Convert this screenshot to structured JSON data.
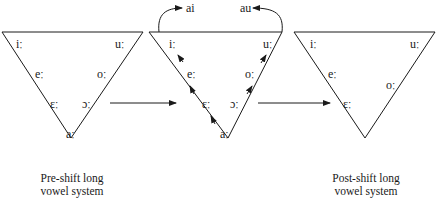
{
  "diagram": {
    "panels": [
      {
        "id": "pre-shift",
        "caption_line1": "Pre-shift long",
        "caption_line2": "vowel system",
        "vowels": {
          "i": "iː",
          "u": "uː",
          "e": "eː",
          "o": "oː",
          "eh": "ɛː",
          "oh": "ɔː",
          "a": "aː"
        }
      },
      {
        "id": "shift",
        "vowels": {
          "i": "iː",
          "u": "uː",
          "e": "eː",
          "o": "oː",
          "eh": "ɛː",
          "oh": "ɔː",
          "a": "aː"
        },
        "diphthongs": {
          "ai": "ai",
          "au": "au"
        }
      },
      {
        "id": "post-shift",
        "caption_line1": "Post-shift long",
        "caption_line2": "vowel system",
        "vowels": {
          "i": "iː",
          "u": "uː",
          "e": "eː",
          "o": "oː",
          "eh": "ɛː"
        }
      }
    ],
    "colors": {
      "line": "#1a1a1a",
      "background": "#ffffff"
    }
  }
}
